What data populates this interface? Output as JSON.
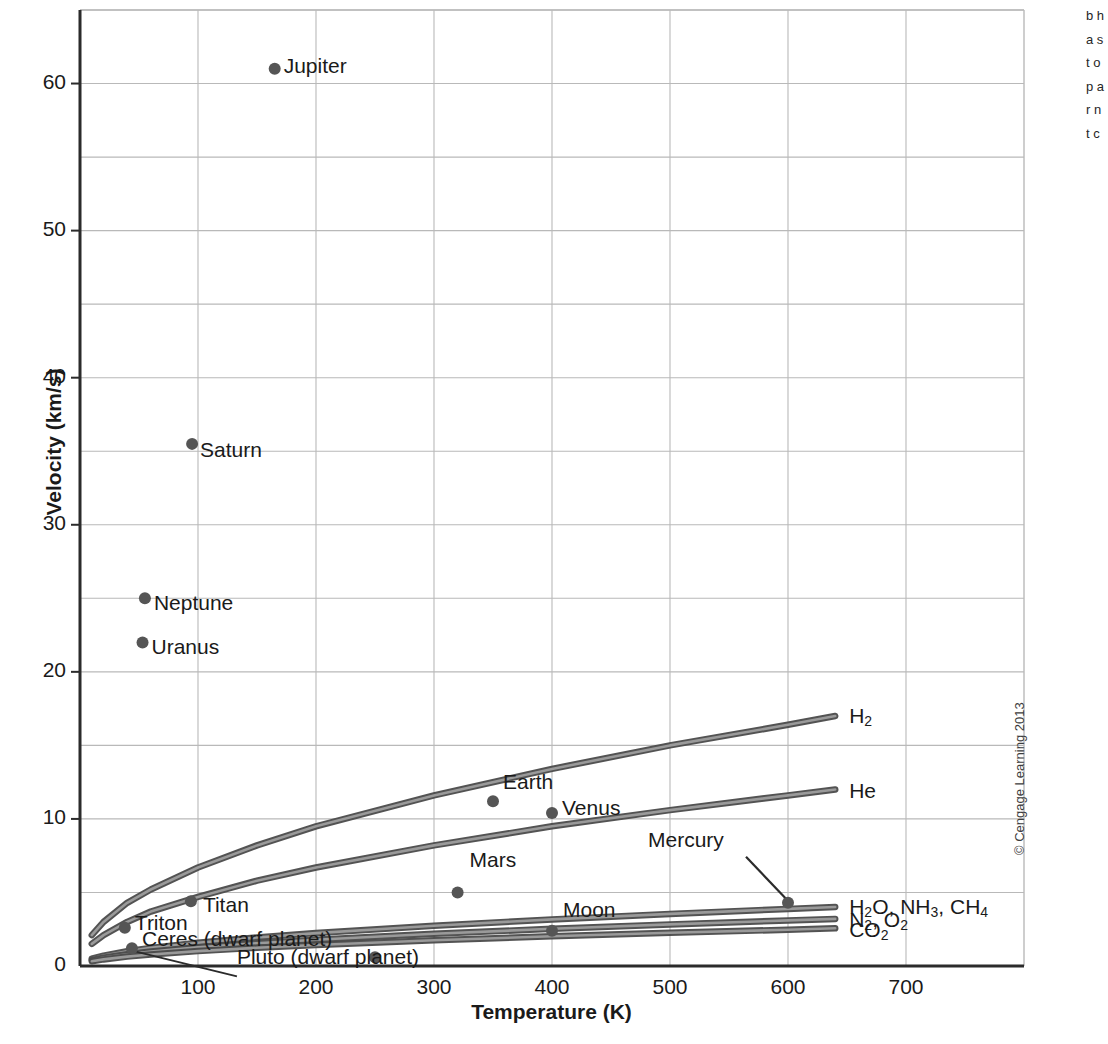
{
  "figure": {
    "credit": "© Cengage Learning 2013",
    "edge_caption_fragment": "b h a s t o p a r n t c"
  },
  "chart_data": {
    "type": "line",
    "title": "",
    "xlabel": "Temperature (K)",
    "ylabel": "Velocity (km/s)",
    "xlim": [
      0,
      800
    ],
    "ylim": [
      0,
      65
    ],
    "xticks": [
      100,
      200,
      300,
      400,
      500,
      600,
      700
    ],
    "yticks": [
      0,
      10,
      20,
      30,
      40,
      50,
      60
    ],
    "grid": true,
    "grid_spacing": {
      "x": 100,
      "y": 5
    },
    "legend_position": "inline-right-of-curves",
    "series": [
      {
        "name": "H2",
        "label": "H₂",
        "label_parts": [
          {
            "t": "H"
          },
          {
            "t": "2",
            "sub": true
          }
        ],
        "x": [
          10,
          20,
          40,
          60,
          100,
          150,
          200,
          300,
          400,
          500,
          600,
          640
        ],
        "y": [
          2.1,
          3.0,
          4.3,
          5.2,
          6.7,
          8.2,
          9.5,
          11.6,
          13.4,
          15.0,
          16.4,
          17.0
        ]
      },
      {
        "name": "He",
        "label": "He",
        "label_parts": [
          {
            "t": "He"
          }
        ],
        "x": [
          10,
          20,
          40,
          60,
          100,
          150,
          200,
          300,
          400,
          500,
          600,
          640
        ],
        "y": [
          1.5,
          2.1,
          3.0,
          3.7,
          4.7,
          5.8,
          6.7,
          8.2,
          9.5,
          10.6,
          11.6,
          12.0
        ]
      },
      {
        "name": "H2O, NH3, CH4",
        "label": "H₂O, NH₃, CH₄",
        "label_parts": [
          {
            "t": "H"
          },
          {
            "t": "2",
            "sub": true
          },
          {
            "t": "O, NH"
          },
          {
            "t": "3",
            "sub": true
          },
          {
            "t": ", CH"
          },
          {
            "t": "4",
            "sub": true
          }
        ],
        "x": [
          10,
          20,
          40,
          60,
          100,
          150,
          200,
          300,
          400,
          500,
          600,
          640
        ],
        "y": [
          0.5,
          0.71,
          1.0,
          1.23,
          1.58,
          1.94,
          2.24,
          2.74,
          3.17,
          3.54,
          3.88,
          4.01
        ]
      },
      {
        "name": "N2, O2",
        "label": "N₂, O₂",
        "label_parts": [
          {
            "t": "N"
          },
          {
            "t": "2",
            "sub": true
          },
          {
            "t": ", O"
          },
          {
            "t": "2",
            "sub": true
          }
        ],
        "x": [
          10,
          20,
          40,
          60,
          100,
          150,
          200,
          300,
          400,
          500,
          600,
          640
        ],
        "y": [
          0.4,
          0.57,
          0.8,
          0.98,
          1.27,
          1.55,
          1.79,
          2.19,
          2.53,
          2.83,
          3.1,
          3.2
        ]
      },
      {
        "name": "CO2",
        "label": "CO₂",
        "label_parts": [
          {
            "t": "CO"
          },
          {
            "t": "2",
            "sub": true
          }
        ],
        "x": [
          10,
          20,
          40,
          60,
          100,
          150,
          200,
          300,
          400,
          500,
          600,
          640
        ],
        "y": [
          0.32,
          0.45,
          0.64,
          0.78,
          1.01,
          1.24,
          1.43,
          1.75,
          2.02,
          2.26,
          2.47,
          2.56
        ]
      }
    ],
    "points": [
      {
        "name": "Jupiter",
        "x": 165,
        "y": 61.0,
        "label": "Jupiter",
        "label_pos": "right"
      },
      {
        "name": "Saturn",
        "x": 95,
        "y": 35.5,
        "label": "Saturn",
        "label_pos": "below-right"
      },
      {
        "name": "Neptune",
        "x": 55,
        "y": 25.0,
        "label": "Neptune",
        "label_pos": "below-right"
      },
      {
        "name": "Uranus",
        "x": 53,
        "y": 22.0,
        "label": "Uranus",
        "label_pos": "below-right"
      },
      {
        "name": "Earth",
        "x": 350,
        "y": 11.2,
        "label": "Earth",
        "label_pos": "right"
      },
      {
        "name": "Venus",
        "x": 400,
        "y": 10.4,
        "label": "Venus",
        "label_pos": "right"
      },
      {
        "name": "Mars",
        "x": 320,
        "y": 5.0,
        "label": "Mars",
        "label_pos": "above-right"
      },
      {
        "name": "Titan",
        "x": 94,
        "y": 4.4,
        "label": "Titan",
        "label_pos": "below-right"
      },
      {
        "name": "Mercury",
        "x": 600,
        "y": 4.3,
        "label": "Mercury",
        "label_pos": "leader-upper-left"
      },
      {
        "name": "Triton",
        "x": 38,
        "y": 2.6,
        "label": "Triton",
        "label_pos": "right"
      },
      {
        "name": "Moon",
        "x": 400,
        "y": 2.4,
        "label": "Moon",
        "label_pos": "right"
      },
      {
        "name": "Pluto (dwarf planet)",
        "x": 44,
        "y": 1.2,
        "label": "Pluto (dwarf planet)",
        "label_pos": "leader-lower-right"
      },
      {
        "name": "Ceres (dwarf planet)",
        "x": 250,
        "y": 0.6,
        "label": "Ceres (dwarf planet)",
        "label_pos": "right"
      }
    ],
    "colors": {
      "curve": "#4a4a4a",
      "point": "#555555",
      "grid": "#b9b9b9",
      "axis": "#2b2b2b",
      "text": "#1a1a1a"
    }
  }
}
